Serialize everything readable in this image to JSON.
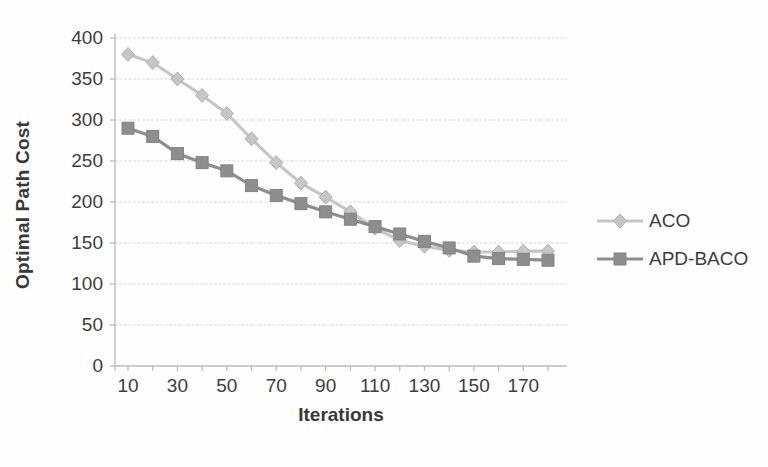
{
  "chart_data": {
    "type": "line",
    "title": "",
    "xlabel": "Iterations",
    "ylabel": "Optimal Path Cost",
    "x": [
      10,
      20,
      30,
      40,
      50,
      60,
      70,
      80,
      90,
      100,
      110,
      120,
      130,
      140,
      150,
      160,
      170,
      180
    ],
    "series": [
      {
        "name": "ACO",
        "marker": "diamond",
        "color": "#c6c6c6",
        "edge": "#b0b0b0",
        "values": [
          380,
          370,
          350,
          330,
          308,
          277,
          248,
          223,
          206,
          188,
          168,
          153,
          146,
          141,
          139,
          139,
          140,
          140
        ]
      },
      {
        "name": "APD-BACO",
        "marker": "square",
        "color": "#8e8e8e",
        "edge": "#828282",
        "values": [
          290,
          280,
          259,
          248,
          238,
          220,
          208,
          198,
          188,
          179,
          170,
          161,
          152,
          144,
          134,
          131,
          130,
          129
        ]
      }
    ],
    "xticks_labeled": [
      10,
      30,
      50,
      70,
      90,
      110,
      130,
      150,
      170
    ],
    "xticks_minor": [
      10,
      20,
      30,
      40,
      50,
      60,
      70,
      80,
      90,
      100,
      110,
      120,
      130,
      140,
      150,
      160,
      170,
      180
    ],
    "yticks": [
      0,
      50,
      100,
      150,
      200,
      250,
      300,
      350,
      400
    ],
    "xlim": [
      4,
      188
    ],
    "ylim": [
      0,
      400
    ],
    "grid": "horizontal-only",
    "legend_position": "right-middle",
    "colors": {
      "gridline": "#d9d9d9",
      "axis": "#bdbdbd",
      "tick": "#bdbdbd",
      "text": "#3d3d3d",
      "background": "#ffffff"
    }
  }
}
